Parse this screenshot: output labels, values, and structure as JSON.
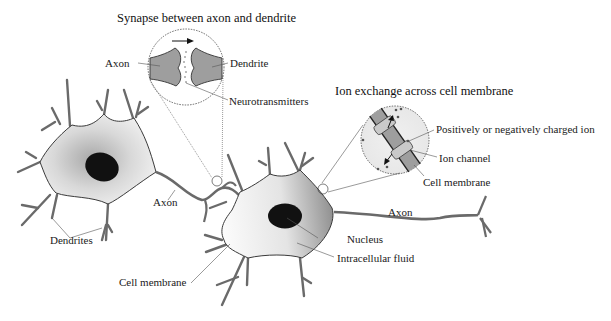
{
  "diagram": {
    "type": "neuron-anatomy",
    "insets": {
      "synapse": {
        "title": "Synapse between axon and dendrite",
        "labels": {
          "axon": "Axon",
          "dendrite": "Dendrite",
          "neurotransmitters": "Neurotransmitters"
        }
      },
      "ion_exchange": {
        "title": "Ion exchange across cell membrane",
        "labels": {
          "charged_ion": "Positively or negatively charged ion",
          "ion_channel": "Ion channel",
          "cell_membrane": "Cell membrane"
        }
      }
    },
    "neuron_left": {
      "labels": {
        "axon": "Axon",
        "dendrites": "Dendrites"
      }
    },
    "neuron_right": {
      "labels": {
        "axon": "Axon",
        "nucleus": "Nucleus",
        "intracellular_fluid": "Intracellular fluid",
        "cell_membrane": "Cell membrane"
      }
    },
    "colors": {
      "stroke": "#3a3a3a",
      "nucleus": "#111111",
      "cell_fill_light": "#f4f4f4",
      "cell_fill_dark": "#9a9a9a",
      "inset_fill": "#9e9e9e",
      "leader_line": "#555555"
    }
  }
}
